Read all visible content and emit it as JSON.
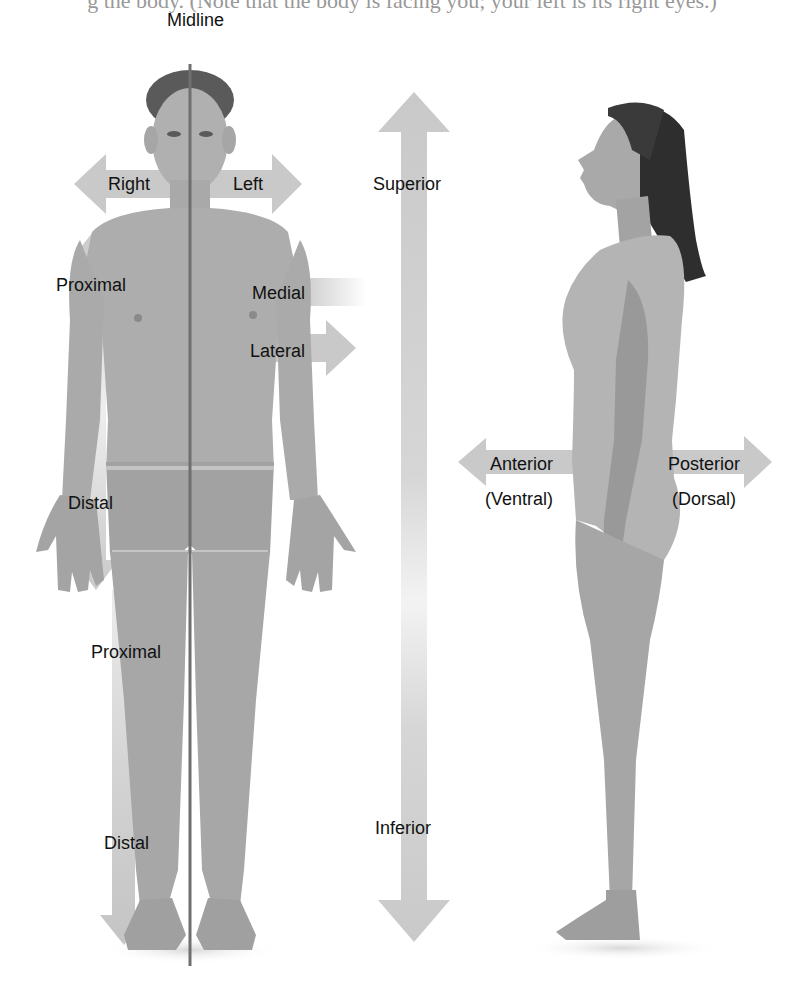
{
  "caption": "g the body. (Note that the body is facing you; your left is its right eyes.)",
  "front_figure": {
    "description": "Male figure, anterior view",
    "midline_label": "Midline",
    "labels": {
      "right": "Right",
      "left": "Left",
      "proximal_arm": "Proximal",
      "distal_arm": "Distal",
      "medial": "Medial",
      "lateral": "Lateral",
      "proximal_leg": "Proximal",
      "distal_leg": "Distal"
    }
  },
  "vertical_axis": {
    "superior": "Superior",
    "inferior": "Inferior"
  },
  "side_figure": {
    "description": "Female figure, lateral view",
    "labels": {
      "anterior": "Anterior",
      "ventral": "(Ventral)",
      "posterior": "Posterior",
      "dorsal": "(Dorsal)"
    }
  },
  "colors": {
    "arrow": "#c9c9c9",
    "skin": "#a9a9a9",
    "skin_dark": "#8f8f8f",
    "hair": "#2e2e2e",
    "midline": "#6f6f6f",
    "text": "#111111"
  }
}
